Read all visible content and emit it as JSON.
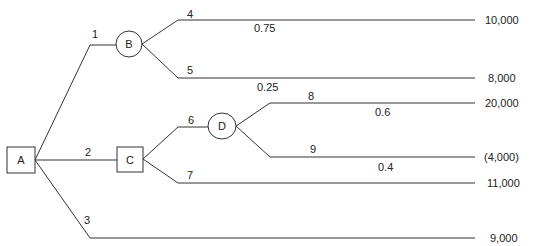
{
  "diagram": {
    "type": "decision-tree",
    "nodes": [
      {
        "id": "A",
        "label": "A",
        "shape": "square",
        "role": "decision"
      },
      {
        "id": "B",
        "label": "B",
        "shape": "circle",
        "role": "chance"
      },
      {
        "id": "C",
        "label": "C",
        "shape": "square",
        "role": "decision"
      },
      {
        "id": "D",
        "label": "D",
        "shape": "circle",
        "role": "chance"
      }
    ],
    "branches": [
      {
        "id": "1",
        "label": "1",
        "from": "A",
        "to": "B"
      },
      {
        "id": "2",
        "label": "2",
        "from": "A",
        "to": "C"
      },
      {
        "id": "3",
        "label": "3",
        "from": "A",
        "to": "payoff",
        "payoff": "9,000"
      },
      {
        "id": "4",
        "label": "4",
        "from": "B",
        "probability": "0.75",
        "payoff": "10,000"
      },
      {
        "id": "5",
        "label": "5",
        "from": "B",
        "probability": "0.25",
        "payoff": "8,000"
      },
      {
        "id": "6",
        "label": "6",
        "from": "C",
        "to": "D"
      },
      {
        "id": "7",
        "label": "7",
        "from": "C",
        "payoff": "11,000"
      },
      {
        "id": "8",
        "label": "8",
        "from": "D",
        "probability": "0.6",
        "payoff": "20,000"
      },
      {
        "id": "9",
        "label": "9",
        "from": "D",
        "probability": "0.4",
        "payoff": "(4,000)"
      }
    ],
    "node_labels": {
      "A": "A",
      "B": "B",
      "C": "C",
      "D": "D"
    },
    "branch_labels": {
      "b1": "1",
      "b2": "2",
      "b3": "3",
      "b4": "4",
      "b5": "5",
      "b6": "6",
      "b7": "7",
      "b8": "8",
      "b9": "9"
    },
    "probabilities": {
      "b4": "0.75",
      "b5": "0.25",
      "b8": "0.6",
      "b9": "0.4"
    },
    "payoffs": {
      "b4": "10,000",
      "b5": "8,000",
      "b8": "20,000",
      "b9": "(4,000)",
      "b7": "11,000",
      "b3": "9,000"
    }
  }
}
